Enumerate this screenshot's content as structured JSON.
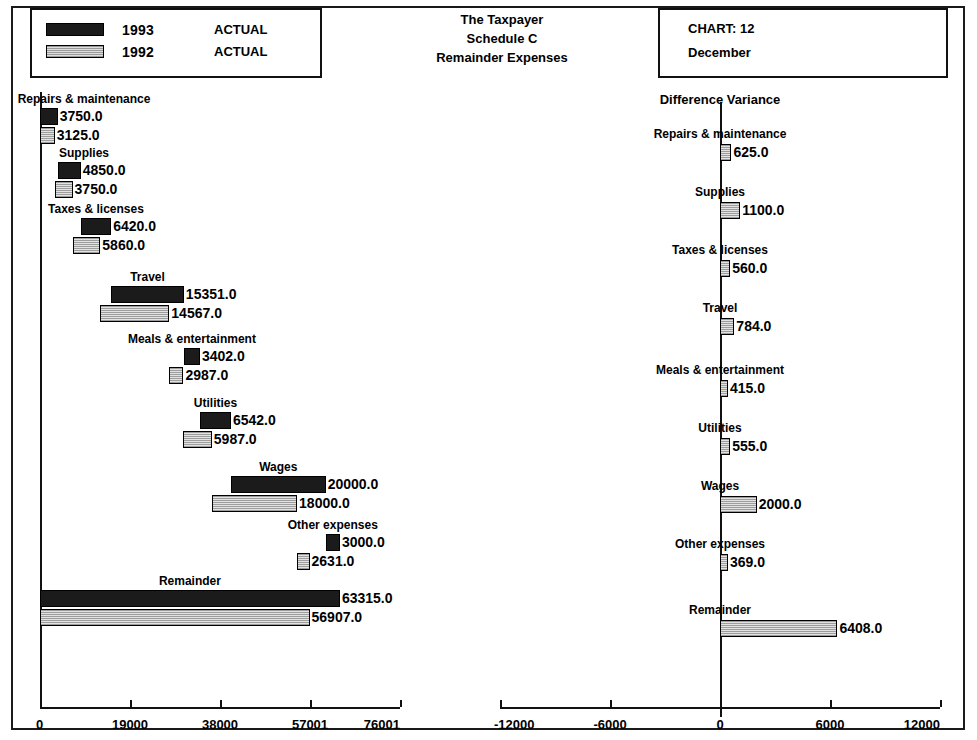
{
  "legend": {
    "rows": [
      {
        "year": "1993",
        "kind": "ACTUAL",
        "swatch": "dark-solid"
      },
      {
        "year": "1992",
        "kind": "ACTUAL",
        "swatch": "light-hatched"
      }
    ]
  },
  "title": {
    "line1": "The Taxpayer",
    "line2": "Schedule C",
    "line3": "Remainder Expenses"
  },
  "chart_meta": {
    "chart_label": "CHART:   12",
    "period": "December"
  },
  "right_panel": {
    "heading": "Difference Variance"
  },
  "chart_data": {
    "type": "bar",
    "subtype": "horizontal cascading waterfall, two panels",
    "categories": [
      "Repairs & maintenance",
      "Supplies",
      "Taxes & licenses",
      "Travel",
      "Meals & entertainment",
      "Utilities",
      "Wages",
      "Other expenses",
      "Remainder"
    ],
    "series": [
      {
        "name": "1993 ACTUAL",
        "values": [
          3750.0,
          4850.0,
          6420.0,
          15351.0,
          3402.0,
          6542.0,
          20000.0,
          3000.0,
          63315.0
        ]
      },
      {
        "name": "1992 ACTUAL",
        "values": [
          3125.0,
          3750.0,
          5860.0,
          14567.0,
          2987.0,
          5987.0,
          18000.0,
          2631.0,
          56907.0
        ]
      },
      {
        "name": "Difference Variance",
        "values": [
          625.0,
          1100.0,
          560.0,
          784.0,
          415.0,
          555.0,
          2000.0,
          369.0,
          6408.0
        ]
      }
    ],
    "value_labels": {
      "s1993": [
        "3750.0",
        "4850.0",
        "6420.0",
        "15351.0",
        "3402.0",
        "6542.0",
        "20000.0",
        "3000.0",
        "63315.0"
      ],
      "s1992": [
        "3125.0",
        "3750.0",
        "5860.0",
        "14567.0",
        "2987.0",
        "5987.0",
        "18000.0",
        "2631.0",
        "56907.0"
      ],
      "variance": [
        "625.0",
        "1100.0",
        "560.0",
        "784.0",
        "415.0",
        "555.0",
        "2000.0",
        "369.0",
        "6408.0"
      ]
    },
    "left_axis": {
      "ticks": [
        "0",
        "19000",
        "38000",
        "57001",
        "76001"
      ],
      "min": 0,
      "max": 76001
    },
    "right_axis": {
      "ticks": [
        "-12000",
        "-6000",
        "0",
        "6000",
        "12000"
      ],
      "min": -12000,
      "max": 12000
    },
    "grid": false,
    "legend_position": "top-left"
  }
}
